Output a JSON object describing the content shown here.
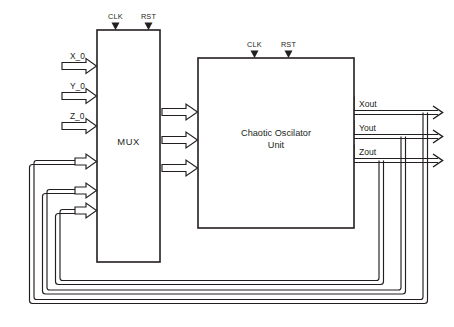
{
  "diagram": {
    "background_color": "#ffffff",
    "line_color": "#231f20",
    "blocks": [
      {
        "id": "mux",
        "label": "MUX",
        "clock_label": "CLK",
        "reset_label": "RST"
      },
      {
        "id": "oscillator",
        "label_line1": "Chaotic Oscilator",
        "label_line2": "Unit",
        "clock_label": "CLK",
        "reset_label": "RST"
      }
    ],
    "inputs": [
      {
        "label": "X_0"
      },
      {
        "label": "Y_0"
      },
      {
        "label": "Z_0"
      }
    ],
    "outputs": [
      {
        "label": "Xout"
      },
      {
        "label": "Yout"
      },
      {
        "label": "Zout"
      }
    ],
    "feedback": {
      "count": 3,
      "description": "Xout, Yout and Zout routed back to MUX inputs"
    },
    "internal_buses": {
      "count": 3,
      "description": "MUX to Chaotic Oscillator Unit"
    }
  }
}
